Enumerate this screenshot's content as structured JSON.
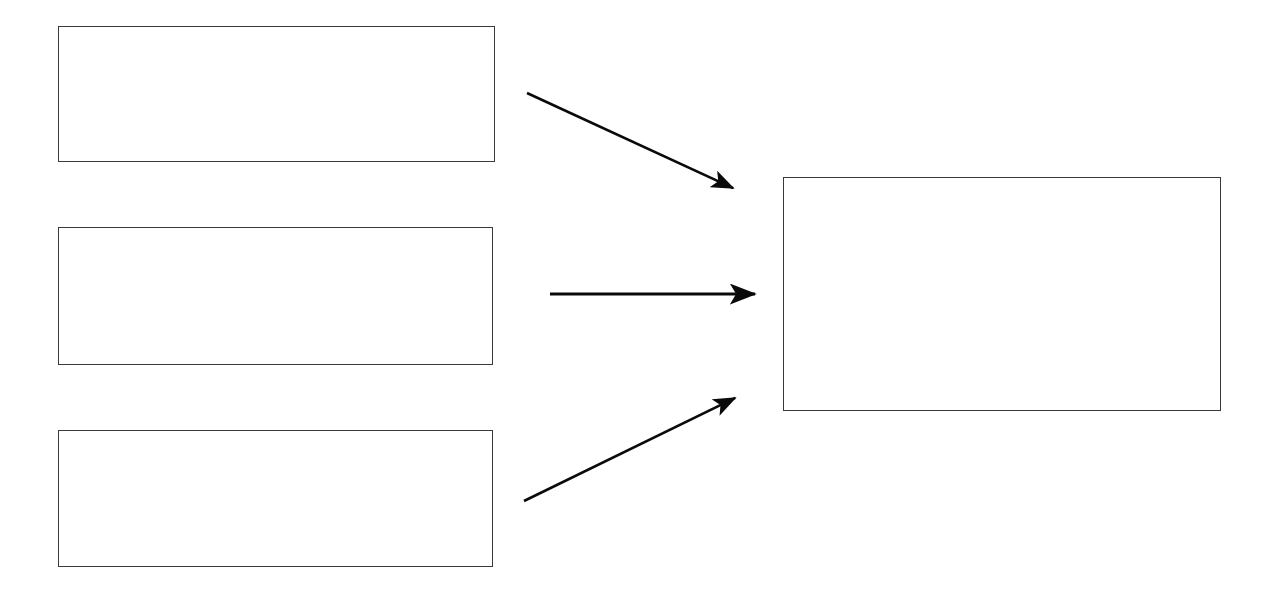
{
  "diagram": {
    "title": "",
    "background_color": "#ffffff",
    "stroke_color": "#3a3a3a",
    "arrow_color": "#0a0a0a",
    "width": 1276,
    "height": 589,
    "nodes": [
      {
        "id": "source-1",
        "label": "",
        "role": "source",
        "x": 58,
        "y": 26,
        "width": 437,
        "height": 136
      },
      {
        "id": "source-2",
        "label": "",
        "role": "source",
        "x": 58,
        "y": 227,
        "width": 435,
        "height": 138
      },
      {
        "id": "source-3",
        "label": "",
        "role": "source",
        "x": 58,
        "y": 430,
        "width": 435,
        "height": 137
      },
      {
        "id": "target",
        "label": "",
        "role": "target",
        "x": 783,
        "y": 177,
        "width": 438,
        "height": 234
      }
    ],
    "connectors": [
      {
        "id": "arrow-1",
        "label": "",
        "from": "source-1",
        "to": "target",
        "direction": "down-right",
        "x1": 527,
        "y1": 93,
        "x2": 735,
        "y2": 189
      },
      {
        "id": "arrow-2",
        "label": "",
        "from": "source-2",
        "to": "target",
        "direction": "right",
        "x1": 550,
        "y1": 294,
        "x2": 757,
        "y2": 294
      },
      {
        "id": "arrow-3",
        "label": "",
        "from": "source-3",
        "to": "target",
        "direction": "up-right",
        "x1": 524,
        "y1": 501,
        "x2": 737,
        "y2": 397
      }
    ]
  }
}
